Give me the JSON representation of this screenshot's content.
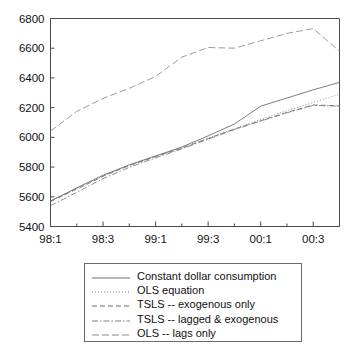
{
  "chart_data": {
    "type": "line",
    "title": "",
    "xlabel": "",
    "ylabel": "",
    "ylim": [
      5400,
      6800
    ],
    "yticks": [
      5400,
      5600,
      5800,
      6000,
      6200,
      6400,
      6600,
      6800
    ],
    "ytick_labels": [
      "5400",
      "5600",
      "5800",
      "6000",
      "6200",
      "6400",
      "6600",
      "6800"
    ],
    "grid": false,
    "legend_position": "below-center",
    "x": [
      "98:1",
      "98:2",
      "98:3",
      "98:4",
      "99:1",
      "99:2",
      "99:3",
      "99:4",
      "00:1",
      "00:2",
      "00:3",
      "00:4"
    ],
    "xtick_labels": [
      "98:1",
      "98:3",
      "99:1",
      "99:3",
      "00:1",
      "00:3"
    ],
    "xtick_positions": [
      0,
      2,
      4,
      6,
      8,
      10
    ],
    "series": [
      {
        "name": "Constant dollar consumption",
        "style": "solid",
        "color": "#6e6e6e",
        "values": [
          5572,
          5660,
          5745,
          5815,
          5875,
          5935,
          6010,
          6090,
          6210,
          6265,
          6320,
          6370
        ]
      },
      {
        "name": "OLS equation",
        "style": "dotted",
        "color": "#7a7a7a",
        "values": [
          5570,
          5655,
          5740,
          5812,
          5872,
          5930,
          5995,
          6060,
          6120,
          6180,
          6235,
          6290
        ]
      },
      {
        "name": "TSLS -- exogenous only",
        "style": "dashed",
        "color": "#6a6a6a",
        "values": [
          5568,
          5652,
          5738,
          5810,
          5870,
          5928,
          5992,
          6055,
          6112,
          6168,
          6218,
          6212
        ]
      },
      {
        "name": "TSLS -- lagged & exogenous",
        "style": "dashdot",
        "color": "#7d7d7d",
        "values": [
          5540,
          5630,
          5722,
          5798,
          5862,
          5922,
          5988,
          6052,
          6110,
          6165,
          6215,
          6210
        ]
      },
      {
        "name": "OLS -- lags only",
        "style": "longdash",
        "color": "#8a8a8a",
        "values": [
          6042,
          6175,
          6262,
          6330,
          6410,
          6540,
          6605,
          6600,
          6650,
          6700,
          6732,
          6580
        ]
      }
    ]
  },
  "legend": {
    "items": [
      {
        "label": "Constant dollar consumption",
        "swatch": "legend-swatch-solid"
      },
      {
        "label": "OLS equation",
        "swatch": "legend-swatch-dotted"
      },
      {
        "label": "TSLS -- exogenous only",
        "swatch": "legend-swatch-dashed"
      },
      {
        "label": "TSLS -- lagged & exogenous",
        "swatch": "legend-swatch-dashdot"
      },
      {
        "label": "OLS -- lags only",
        "swatch": "legend-swatch-longdash"
      }
    ]
  }
}
